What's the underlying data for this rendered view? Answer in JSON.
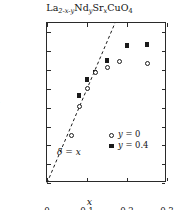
{
  "chart_data": {
    "type": "scatter",
    "title": "La2-x-yNdySrxCuO4",
    "xlabel": "x",
    "ylabel": "δ/r.l.u.",
    "xlim": [
      0,
      0.3
    ],
    "ylim": [
      0,
      0.17
    ],
    "grid": false,
    "legend_position": "inside-lower-right",
    "xticks": [
      "0",
      "0.1",
      "0.2",
      "0.3"
    ],
    "xtick_values": [
      0,
      0.1,
      0.2,
      0.3
    ],
    "yticks": [
      "0.00",
      "0.02",
      "0.04",
      "0.06",
      "0.08",
      "0.10",
      "0.12",
      "0.14",
      "0.16"
    ],
    "ytick_values": [
      0.0,
      0.02,
      0.04,
      0.06,
      0.08,
      0.1,
      0.12,
      0.14,
      0.16
    ],
    "annotations": [
      {
        "text": "δ = x",
        "x": 0.033,
        "y": 0.021,
        "note": "label for dashed guide line"
      }
    ],
    "guide_line": {
      "style": "dashed",
      "label": "δ = x",
      "from": [
        0.0,
        0.0
      ],
      "to": [
        0.17,
        0.17
      ]
    },
    "series": [
      {
        "name": "y = 0",
        "marker": "open-circle",
        "color": "#1a1a1a",
        "x": [
          0.06,
          0.08,
          0.1,
          0.12,
          0.15,
          0.18,
          0.25
        ],
        "y": [
          0.05,
          0.081,
          0.1,
          0.117,
          0.123,
          0.129,
          0.127
        ]
      },
      {
        "name": "y = 0.4",
        "marker": "filled-square",
        "color": "#1a1a1a",
        "x": [
          0.08,
          0.1,
          0.12,
          0.15,
          0.2,
          0.25
        ],
        "y": [
          0.093,
          0.11,
          0.118,
          0.13,
          0.146,
          0.147
        ]
      }
    ]
  },
  "title_parts": {
    "la": "La",
    "la_sub": "2-x-y",
    "nd": "Nd",
    "nd_sub": "y",
    "sr": "Sr",
    "sr_sub": "x",
    "cu": "CuO",
    "cu_sub": "4"
  },
  "legend": {
    "items": [
      {
        "marker": "open-circle",
        "label_var": "y",
        "label_eq": " = 0"
      },
      {
        "marker": "filled-square",
        "label_var": "y",
        "label_eq": " = 0.4"
      }
    ]
  },
  "annotation": {
    "delta": "δ",
    "equals": " = ",
    "x": "x"
  },
  "axes": {
    "ylabel_delta": "δ",
    "ylabel_rest": "/r.l.u.",
    "xlabel": "x"
  }
}
